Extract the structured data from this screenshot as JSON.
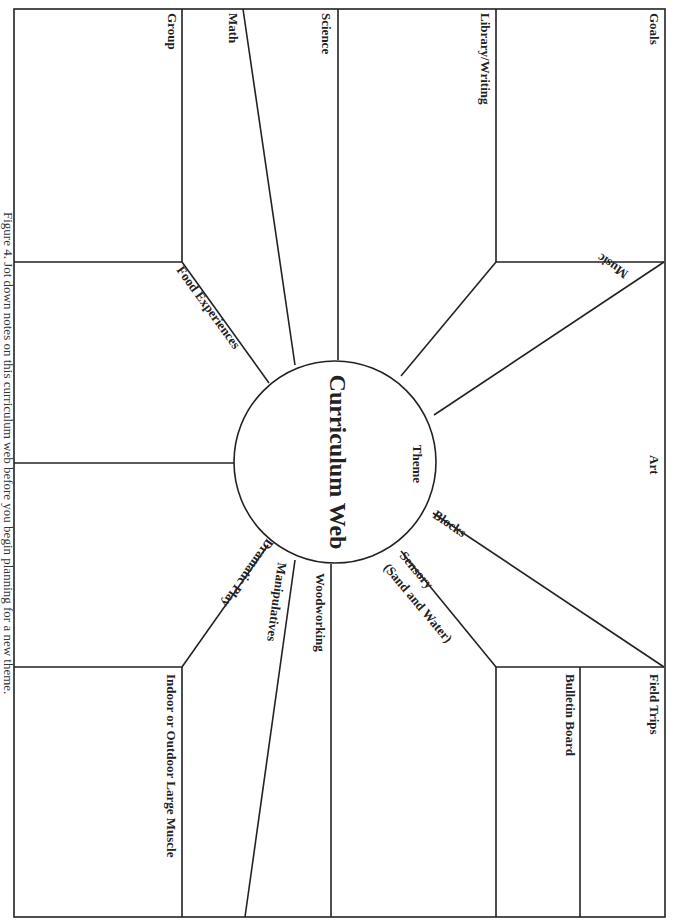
{
  "diagram": {
    "title": "Curriculum Web",
    "center_label": "Theme",
    "caption": "Figure 4. Jot down notes on this curriculum web before you begin planning for a new theme.",
    "sections": [
      {
        "id": "goals",
        "label": "Goals"
      },
      {
        "id": "library-writing",
        "label": "Library/Writing"
      },
      {
        "id": "science",
        "label": "Science"
      },
      {
        "id": "math",
        "label": "Math"
      },
      {
        "id": "group",
        "label": "Group"
      },
      {
        "id": "food-experiences",
        "label": "Food Experiences"
      },
      {
        "id": "music",
        "label": "Music"
      },
      {
        "id": "art",
        "label": "Art"
      },
      {
        "id": "blocks",
        "label": "Blocks"
      },
      {
        "id": "sensory",
        "label": "Sensory",
        "sublabel": "(Sand and Water)"
      },
      {
        "id": "field-trips",
        "label": "Field Trips"
      },
      {
        "id": "bulletin-board",
        "label": "Bulletin Board"
      },
      {
        "id": "woodworking",
        "label": "Woodworking"
      },
      {
        "id": "manipulatives",
        "label": "Manipulatives"
      },
      {
        "id": "dramatic-play",
        "label": "Dramatic Play"
      },
      {
        "id": "indoor-outdoor-large-muscle",
        "label": "Indoor or Outdoor Large Muscle"
      }
    ]
  }
}
